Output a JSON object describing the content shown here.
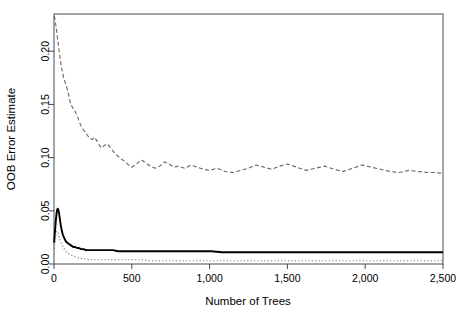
{
  "chart_data": {
    "type": "line",
    "title": "",
    "subtitle": "",
    "xlabel": "Number of Trees",
    "ylabel": "OOB Error Estimate",
    "xlim": [
      0,
      2500
    ],
    "ylim": [
      0.0,
      0.235
    ],
    "xticks": [
      0,
      500,
      1000,
      1500,
      2000,
      2500
    ],
    "xtick_labels": [
      "0",
      "500",
      "1,000",
      "1,500",
      "2,000",
      "2,500"
    ],
    "yticks": [
      0.0,
      0.05,
      0.1,
      0.15,
      0.2
    ],
    "ytick_labels": [
      "0.00",
      "0.05",
      "0.10",
      "0.15",
      "0.20"
    ],
    "grid": false,
    "legend": "none",
    "box": true,
    "series": [
      {
        "name": "class-error-upper",
        "style": "dashed",
        "color": "#666666",
        "width": 1.1,
        "x": [
          1,
          5,
          9,
          13,
          17,
          21,
          25,
          29,
          33,
          37,
          41,
          45,
          49,
          55,
          61,
          67,
          73,
          80,
          88,
          96,
          104,
          112,
          120,
          130,
          140,
          150,
          160,
          170,
          180,
          190,
          200,
          215,
          230,
          245,
          260,
          275,
          290,
          305,
          320,
          340,
          360,
          380,
          400,
          420,
          440,
          460,
          480,
          500,
          530,
          560,
          590,
          620,
          650,
          680,
          710,
          740,
          770,
          800,
          840,
          880,
          920,
          960,
          1000,
          1050,
          1100,
          1150,
          1200,
          1250,
          1300,
          1350,
          1400,
          1450,
          1500,
          1560,
          1620,
          1680,
          1740,
          1800,
          1860,
          1920,
          1980,
          2040,
          2100,
          2160,
          2220,
          2280,
          2340,
          2400,
          2460,
          2500
        ],
        "y": [
          0.233,
          0.231,
          0.228,
          0.223,
          0.219,
          0.214,
          0.209,
          0.205,
          0.2,
          0.196,
          0.192,
          0.188,
          0.184,
          0.18,
          0.176,
          0.173,
          0.17,
          0.167,
          0.163,
          0.158,
          0.152,
          0.149,
          0.147,
          0.145,
          0.142,
          0.139,
          0.135,
          0.131,
          0.128,
          0.126,
          0.124,
          0.121,
          0.118,
          0.117,
          0.119,
          0.116,
          0.112,
          0.109,
          0.111,
          0.113,
          0.11,
          0.106,
          0.103,
          0.1,
          0.098,
          0.096,
          0.093,
          0.091,
          0.094,
          0.098,
          0.095,
          0.092,
          0.09,
          0.092,
          0.096,
          0.094,
          0.091,
          0.092,
          0.09,
          0.093,
          0.091,
          0.089,
          0.088,
          0.09,
          0.087,
          0.086,
          0.088,
          0.09,
          0.093,
          0.091,
          0.089,
          0.092,
          0.094,
          0.091,
          0.088,
          0.09,
          0.092,
          0.089,
          0.087,
          0.09,
          0.093,
          0.091,
          0.089,
          0.087,
          0.086,
          0.088,
          0.087,
          0.086,
          0.086,
          0.085
        ]
      },
      {
        "name": "oob-overall-error",
        "style": "solid",
        "color": "#000000",
        "width": 1.9,
        "x": [
          1,
          4,
          8,
          12,
          16,
          20,
          24,
          28,
          32,
          36,
          40,
          44,
          48,
          52,
          58,
          64,
          70,
          78,
          86,
          94,
          104,
          114,
          124,
          136,
          148,
          160,
          175,
          190,
          205,
          220,
          240,
          260,
          280,
          300,
          325,
          350,
          380,
          410,
          440,
          470,
          500,
          550,
          600,
          650,
          700,
          750,
          800,
          870,
          940,
          1010,
          1080,
          1150,
          1250,
          1350,
          1450,
          1550,
          1650,
          1750,
          1850,
          1950,
          2050,
          2150,
          2250,
          2350,
          2450,
          2500
        ],
        "y": [
          0.02,
          0.026,
          0.034,
          0.041,
          0.047,
          0.051,
          0.052,
          0.051,
          0.048,
          0.044,
          0.04,
          0.036,
          0.033,
          0.03,
          0.027,
          0.025,
          0.023,
          0.021,
          0.02,
          0.019,
          0.018,
          0.017,
          0.016,
          0.016,
          0.015,
          0.015,
          0.014,
          0.014,
          0.013,
          0.013,
          0.013,
          0.013,
          0.013,
          0.013,
          0.013,
          0.013,
          0.013,
          0.012,
          0.012,
          0.012,
          0.012,
          0.012,
          0.012,
          0.012,
          0.012,
          0.012,
          0.012,
          0.012,
          0.012,
          0.012,
          0.011,
          0.011,
          0.011,
          0.011,
          0.011,
          0.011,
          0.011,
          0.011,
          0.011,
          0.011,
          0.011,
          0.011,
          0.011,
          0.011,
          0.011,
          0.011
        ]
      },
      {
        "name": "class-error-lower",
        "style": "dotted",
        "color": "#777777",
        "width": 1.1,
        "x": [
          1,
          5,
          10,
          15,
          20,
          25,
          30,
          36,
          42,
          48,
          55,
          62,
          70,
          80,
          90,
          100,
          115,
          130,
          145,
          160,
          180,
          200,
          225,
          250,
          280,
          310,
          345,
          380,
          420,
          460,
          500,
          560,
          620,
          680,
          750,
          820,
          900,
          980,
          1060,
          1150,
          1250,
          1350,
          1450,
          1550,
          1650,
          1750,
          1850,
          1950,
          2050,
          2150,
          2250,
          2350,
          2450,
          2500
        ],
        "y": [
          0.014,
          0.019,
          0.026,
          0.03,
          0.031,
          0.03,
          0.027,
          0.024,
          0.021,
          0.019,
          0.017,
          0.015,
          0.013,
          0.011,
          0.01,
          0.009,
          0.008,
          0.007,
          0.006,
          0.006,
          0.005,
          0.005,
          0.004,
          0.004,
          0.004,
          0.004,
          0.004,
          0.004,
          0.004,
          0.004,
          0.004,
          0.004,
          0.003,
          0.003,
          0.003,
          0.003,
          0.003,
          0.003,
          0.003,
          0.003,
          0.003,
          0.003,
          0.003,
          0.003,
          0.003,
          0.003,
          0.003,
          0.003,
          0.003,
          0.003,
          0.003,
          0.003,
          0.003,
          0.003
        ]
      }
    ]
  },
  "axes": {
    "x_label": "Number of Trees",
    "y_label": "OOB Error Estimate"
  }
}
